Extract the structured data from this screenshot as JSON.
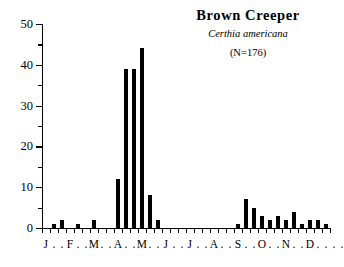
{
  "chart_data": {
    "type": "bar",
    "title": "Brown  Creeper",
    "subtitle": "Certhia americana",
    "annotation": "(N=176)",
    "xlabel": "",
    "ylabel": "",
    "ylim": [
      0,
      50
    ],
    "y_major_ticks": [
      0,
      10,
      20,
      30,
      40,
      50
    ],
    "y_minor_ticks": [
      5,
      15,
      25,
      35,
      45
    ],
    "grid": false,
    "legend": "none",
    "bar_color": "#000000",
    "bins_per_month": 3,
    "categories": [
      "Jan 1",
      "Jan 2",
      "Jan 3",
      "Feb 1",
      "Feb 2",
      "Feb 3",
      "Mar 1",
      "Mar 2",
      "Mar 3",
      "Apr 1",
      "Apr 2",
      "Apr 3",
      "May 1",
      "May 2",
      "May 3",
      "Jun 1",
      "Jun 2",
      "Jun 3",
      "Jul 1",
      "Jul 2",
      "Jul 3",
      "Aug 1",
      "Aug 2",
      "Aug 3",
      "Sep 1",
      "Sep 2",
      "Sep 3",
      "Oct 1",
      "Oct 2",
      "Oct 3",
      "Nov 1",
      "Nov 2",
      "Nov 3",
      "Dec 1",
      "Dec 2",
      "Dec 3"
    ],
    "values": [
      0,
      1,
      2,
      0,
      1,
      0,
      2,
      0,
      0,
      12,
      39,
      39,
      44,
      8,
      2,
      0,
      0,
      0,
      0,
      0,
      0,
      0,
      0,
      0,
      1,
      7,
      5,
      3,
      2,
      3,
      2,
      4,
      1,
      2,
      2,
      1
    ],
    "month_labels": [
      "J",
      "F",
      "M",
      "A",
      "M",
      "J",
      "J",
      "A",
      "S",
      "O",
      "N",
      "D"
    ],
    "axis_label_separator": "."
  }
}
